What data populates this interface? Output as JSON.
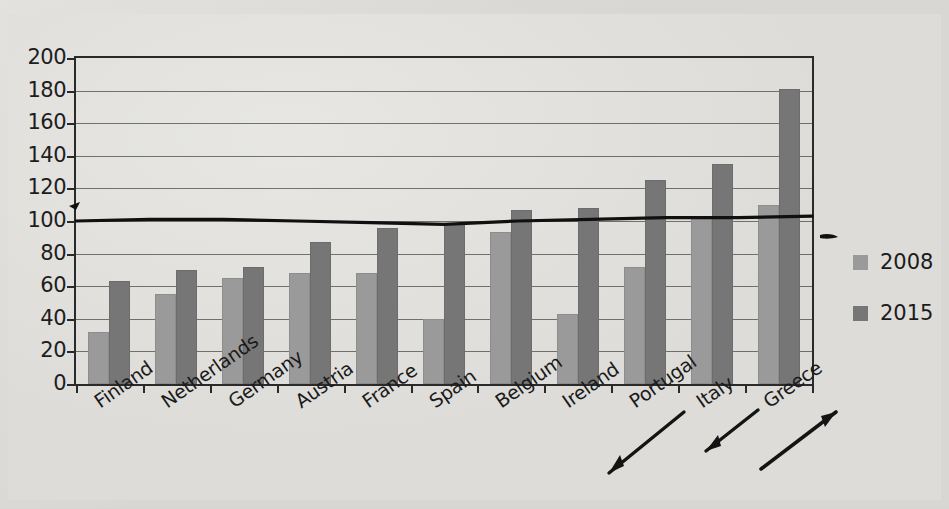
{
  "chart_data": {
    "type": "bar",
    "title": "",
    "subtitle": "",
    "xlabel": "",
    "ylabel": "",
    "ylim": [
      0,
      200
    ],
    "ytick_step": 20,
    "yticks": [
      "200",
      "180",
      "160",
      "140",
      "120",
      "100",
      "80",
      "60",
      "40",
      "20",
      "0"
    ],
    "grid": true,
    "legend_position": "right",
    "categories": [
      "Finland",
      "Netherlands",
      "Germany",
      "Austria",
      "France",
      "Spain",
      "Belgium",
      "Ireland",
      "Portugal",
      "Italy",
      "Greece"
    ],
    "series": [
      {
        "name": "2008",
        "color": "#9a9a9a",
        "values": [
          32,
          55,
          65,
          68,
          68,
          40,
          93,
          43,
          72,
          102,
          110
        ]
      },
      {
        "name": "2015",
        "color": "#767676",
        "values": [
          63,
          70,
          72,
          87,
          96,
          99,
          107,
          108,
          125,
          135,
          181
        ]
      }
    ],
    "annotations": [
      {
        "name": "reference-line",
        "type": "line",
        "label": "",
        "approx_value": 100,
        "color": "#101010",
        "points": [
          100,
          101,
          101,
          100,
          99,
          98,
          100,
          101,
          102,
          102,
          103
        ]
      },
      {
        "name": "arrow-portugal",
        "type": "arrow",
        "direction": "down-left"
      },
      {
        "name": "arrow-italy",
        "type": "arrow",
        "direction": "down-left"
      },
      {
        "name": "arrow-greece",
        "type": "arrow",
        "direction": "up-right"
      },
      {
        "name": "arrow-reference-line",
        "type": "arrowhead",
        "direction": "left"
      }
    ]
  },
  "legend": {
    "items": [
      {
        "label": "2008",
        "color": "#9a9a9a"
      },
      {
        "label": "2015",
        "color": "#767676"
      }
    ]
  }
}
